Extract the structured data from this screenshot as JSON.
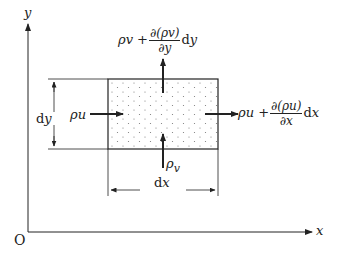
{
  "diagram": {
    "axes": {
      "origin_label": "O",
      "x_label": "x",
      "y_label": "y"
    },
    "element": {
      "width_label_d": "d",
      "width_label_var": "x",
      "height_label_d": "d",
      "height_label_var": "y"
    },
    "fluxes": {
      "left_in": "ρu",
      "bottom_in_rho": "ρ",
      "bottom_in_sub": "v",
      "right_out_prefix": "ρu +",
      "right_out_num": "∂(ρu)",
      "right_out_den": "∂x",
      "right_out_suffix_d": "d",
      "right_out_suffix_var": "x",
      "top_out_prefix": "ρv +",
      "top_out_num": "∂(ρv)",
      "top_out_den": "∂y",
      "top_out_suffix_d": "d",
      "top_out_suffix_var": "y"
    },
    "colors": {
      "line": "#222222",
      "fill_dots": "#777777",
      "background": "#ffffff"
    }
  }
}
